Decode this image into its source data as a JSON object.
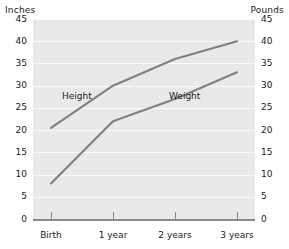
{
  "chart_data": {
    "type": "line",
    "title": "",
    "categories": [
      "Birth",
      "1 year",
      "2 years",
      "3 years"
    ],
    "series": [
      {
        "name": "Height",
        "unit": "Inches",
        "axis": "left",
        "values": [
          20.5,
          30,
          36,
          40
        ]
      },
      {
        "name": "Weight",
        "unit": "Pounds",
        "axis": "right",
        "values": [
          8,
          22,
          27,
          33
        ]
      }
    ],
    "xlabel": "",
    "ylabel_left": "Inches",
    "ylabel_right": "Pounds",
    "ylim": [
      0,
      45
    ],
    "ytick_values": [
      45,
      40,
      35,
      30,
      25,
      20,
      15,
      10,
      5,
      0
    ],
    "ytick_labels_left": [
      "45",
      "40",
      "35",
      "30",
      "25",
      "20",
      "15",
      "10",
      "5",
      "0"
    ],
    "ytick_labels_right": [
      "45",
      "40",
      "35",
      "30",
      "25",
      "20",
      "15",
      "10",
      "5",
      "0"
    ],
    "grid": true,
    "grid_orientation": "horizontal",
    "legend": "inline-labels",
    "colors": {
      "plot_background": "#e9e9e9",
      "gridline": "#fbfbfb",
      "line": "#808080",
      "axis": "#8a8a8a",
      "text": "#1a1a1a",
      "page_background": "#ffffff"
    }
  },
  "axes": {
    "left_title": "Inches",
    "right_title": "Pounds",
    "ticks": [
      {
        "value": 45,
        "left": "45",
        "right": "45"
      },
      {
        "value": 40,
        "left": "40",
        "right": "40"
      },
      {
        "value": 35,
        "left": "35",
        "right": "35"
      },
      {
        "value": 30,
        "left": "30",
        "right": "30"
      },
      {
        "value": 25,
        "left": "25",
        "right": "25"
      },
      {
        "value": 20,
        "left": "20",
        "right": "20"
      },
      {
        "value": 15,
        "left": "15",
        "right": "15"
      },
      {
        "value": 10,
        "left": "10",
        "right": "10"
      },
      {
        "value": 5,
        "left": "5",
        "right": "5"
      },
      {
        "value": 0,
        "left": "0",
        "right": "0"
      }
    ],
    "categories": [
      {
        "label": "Birth"
      },
      {
        "label": "1 year"
      },
      {
        "label": "2 years"
      },
      {
        "label": "3 years"
      }
    ]
  },
  "inline_labels": {
    "height": "Height",
    "weight": "Weight"
  }
}
